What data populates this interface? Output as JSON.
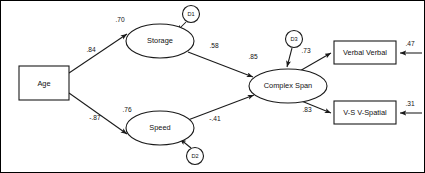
{
  "figure": {
    "type": "path-diagram",
    "title": "",
    "border": true,
    "background_color": "#ffffff",
    "line_color": "#1a1a1a",
    "text_color": "#111111"
  },
  "nodes": {
    "observed": [
      {
        "id": "age",
        "label": "Age",
        "shape": "rectangle",
        "x": 19,
        "y": 66,
        "w": 50,
        "h": 34
      },
      {
        "id": "verbal",
        "label": "Verbal Verbal",
        "shape": "rectangle",
        "x": 334,
        "y": 41,
        "w": 62,
        "h": 23
      },
      {
        "id": "vspatial",
        "label": "V-S V-Spatial",
        "shape": "rectangle",
        "x": 334,
        "y": 101,
        "w": 62,
        "h": 23
      }
    ],
    "latent": [
      {
        "id": "storage",
        "label": "Storage",
        "shape": "ellipse",
        "cx": 160,
        "cy": 41,
        "rx": 34,
        "ry": 17
      },
      {
        "id": "speed",
        "label": "Speed",
        "shape": "ellipse",
        "cx": 160,
        "cy": 128,
        "rx": 34,
        "ry": 17
      },
      {
        "id": "complexspan",
        "label": "Complex Span",
        "shape": "ellipse",
        "cx": 288,
        "cy": 86,
        "rx": 39,
        "ry": 17
      }
    ],
    "disturbances": [
      {
        "id": "d1",
        "label": "D1",
        "shape": "circle",
        "cx": 191,
        "cy": 14,
        "r": 8.5
      },
      {
        "id": "d2",
        "label": "D2",
        "shape": "circle",
        "cx": 195,
        "cy": 156,
        "r": 8.5
      },
      {
        "id": "d3",
        "label": "D3",
        "shape": "circle",
        "cx": 294,
        "cy": 39,
        "r": 8.5
      }
    ]
  },
  "paths": [
    {
      "id": "age-storage",
      "from": "age",
      "to": "storage",
      "coefficient": ".84",
      "label_x": 91,
      "label_y": 50
    },
    {
      "id": "age-speed",
      "from": "age",
      "to": "speed",
      "coefficient": "-.87",
      "label_x": 95,
      "label_y": 118
    },
    {
      "id": "storage-complexspan",
      "from": "storage",
      "to": "complexspan",
      "coefficient": ".58",
      "label_x": 214,
      "label_y": 46
    },
    {
      "id": "speed-complexspan",
      "from": "speed",
      "to": "complexspan",
      "coefficient": "-.41",
      "label_x": 215,
      "label_y": 119
    },
    {
      "id": "complexspan-verbal",
      "from": "complexspan",
      "to": "verbal",
      "coefficient": ".73",
      "label_x": 306,
      "label_y": 51
    },
    {
      "id": "complexspan-vspatial",
      "from": "complexspan",
      "to": "vspatial",
      "coefficient": ".83",
      "label_x": 307,
      "label_y": 110
    },
    {
      "id": "d1-storage",
      "from": "d1",
      "to": "storage",
      "coefficient": ".70",
      "label_x": 120,
      "label_y": 20
    },
    {
      "id": "d2-speed",
      "from": "d2",
      "to": "speed",
      "coefficient": ".76",
      "label_x": 127,
      "label_y": 110
    },
    {
      "id": "d3-complexspan",
      "from": "d3",
      "to": "complexspan",
      "coefficient": ".85",
      "label_x": 253,
      "label_y": 57
    },
    {
      "id": "residual-verbal",
      "from": "residual",
      "to": "verbal",
      "coefficient": ".47",
      "label_x": 410,
      "label_y": 44
    },
    {
      "id": "residual-vspatial",
      "from": "residual",
      "to": "vspatial",
      "coefficient": ".31",
      "label_x": 410,
      "label_y": 104
    }
  ]
}
